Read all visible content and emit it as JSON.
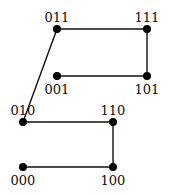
{
  "diagram": {
    "type": "graph",
    "colors": {
      "edge": "#111111",
      "node": "#000000",
      "background": "#ffffff"
    },
    "nodes": [
      {
        "id": "000",
        "label": "000",
        "x": 23,
        "y": 167,
        "label_pos": "below"
      },
      {
        "id": "100",
        "label": "100",
        "x": 113,
        "y": 167,
        "label_pos": "below"
      },
      {
        "id": "010",
        "label": "010",
        "x": 23,
        "y": 122,
        "label_pos": "above"
      },
      {
        "id": "110",
        "label": "110",
        "x": 113,
        "y": 122,
        "label_pos": "above"
      },
      {
        "id": "011",
        "label": "011",
        "x": 57,
        "y": 29,
        "label_pos": "above"
      },
      {
        "id": "111",
        "label": "111",
        "x": 147,
        "y": 29,
        "label_pos": "above"
      },
      {
        "id": "001",
        "label": "001",
        "x": 57,
        "y": 76,
        "label_pos": "below"
      },
      {
        "id": "101",
        "label": "101",
        "x": 147,
        "y": 76,
        "label_pos": "below"
      }
    ],
    "edges": [
      [
        "000",
        "100"
      ],
      [
        "100",
        "110"
      ],
      [
        "110",
        "010"
      ],
      [
        "010",
        "011"
      ],
      [
        "011",
        "111"
      ],
      [
        "111",
        "101"
      ],
      [
        "101",
        "001"
      ]
    ]
  }
}
